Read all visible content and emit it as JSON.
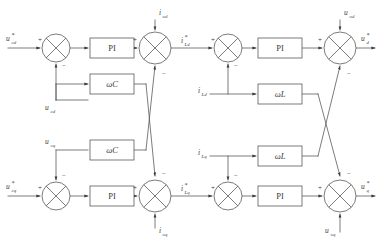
{
  "diagram": {
    "type": "control-block-diagram",
    "title": "",
    "background_color": "#ffffff",
    "line_color": "#5a5a5a",
    "text_color": "#3a3a3a",
    "blocks": [
      {
        "id": "pi-1",
        "label": "PI",
        "x": 90,
        "y": 38,
        "w": 44,
        "h": 20,
        "style": "upright"
      },
      {
        "id": "wc-1",
        "label": "ωC",
        "x": 90,
        "y": 74,
        "w": 44,
        "h": 20,
        "style": "italic"
      },
      {
        "id": "wc-2",
        "label": "ωC",
        "x": 90,
        "y": 140,
        "w": 44,
        "h": 20,
        "style": "italic"
      },
      {
        "id": "pi-2",
        "label": "PI",
        "x": 90,
        "y": 186,
        "w": 44,
        "h": 20,
        "style": "upright"
      },
      {
        "id": "pi-3",
        "label": "PI",
        "x": 258,
        "y": 38,
        "w": 44,
        "h": 20,
        "style": "upright"
      },
      {
        "id": "wl-1",
        "label": "ωL",
        "x": 258,
        "y": 84,
        "w": 44,
        "h": 20,
        "style": "italic"
      },
      {
        "id": "wl-2",
        "label": "ωL",
        "x": 258,
        "y": 146,
        "w": 44,
        "h": 20,
        "style": "italic"
      },
      {
        "id": "pi-4",
        "label": "PI",
        "x": 258,
        "y": 186,
        "w": 44,
        "h": 20,
        "style": "upright"
      }
    ],
    "summers": [
      {
        "id": "sum-1",
        "cx": 56,
        "cy": 48,
        "r": 14
      },
      {
        "id": "sum-2",
        "cx": 155,
        "cy": 48,
        "r": 16
      },
      {
        "id": "sum-3",
        "cx": 56,
        "cy": 196,
        "r": 14
      },
      {
        "id": "sum-4",
        "cx": 155,
        "cy": 196,
        "r": 16
      },
      {
        "id": "sum-5",
        "cx": 228,
        "cy": 48,
        "r": 14
      },
      {
        "id": "sum-6",
        "cx": 340,
        "cy": 48,
        "r": 16
      },
      {
        "id": "sum-7",
        "cx": 228,
        "cy": 196,
        "r": 14
      },
      {
        "id": "sum-8",
        "cx": 340,
        "cy": 196,
        "r": 16
      }
    ],
    "signals": {
      "vref_d": {
        "base": "u",
        "star": true,
        "sub": "cd",
        "x": 6,
        "y": 41
      },
      "vref_q": {
        "base": "u",
        "star": true,
        "sub": "cq",
        "x": 6,
        "y": 189
      },
      "vfb_d": {
        "base": "u",
        "star": false,
        "sub": "cd",
        "x": 47,
        "y": 103
      },
      "vfb_q": {
        "base": "u",
        "star": false,
        "sub": "cq",
        "x": 47,
        "y": 143
      },
      "i_od": {
        "base": "i",
        "star": false,
        "sub": "od",
        "x": 160,
        "y": 14
      },
      "i_oq": {
        "base": "i",
        "star": false,
        "sub": "oq",
        "x": 160,
        "y": 236
      },
      "iref_Ld": {
        "base": "i",
        "star": true,
        "sub": "Ld",
        "x": 182,
        "y": 43
      },
      "iref_Lq": {
        "base": "i",
        "star": true,
        "sub": "Lq",
        "x": 182,
        "y": 191
      },
      "i_Ld": {
        "base": "i",
        "star": false,
        "sub": "Ld",
        "x": 201,
        "y": 93
      },
      "i_Lq": {
        "base": "i",
        "star": false,
        "sub": "Lq",
        "x": 201,
        "y": 155
      },
      "u_od": {
        "base": "u",
        "star": false,
        "sub": "od",
        "x": 345,
        "y": 14
      },
      "u_oq": {
        "base": "u",
        "star": false,
        "sub": "oq",
        "x": 330,
        "y": 236
      },
      "uout_d": {
        "base": "u",
        "star": true,
        "sub": "d",
        "x": 363,
        "y": 41
      },
      "uout_q": {
        "base": "u",
        "star": true,
        "sub": "q",
        "x": 363,
        "y": 189
      }
    },
    "signs": [
      {
        "id": "sign-s1-plus",
        "text": "+",
        "x": 38,
        "y": 42
      },
      {
        "id": "sign-s1-minus",
        "text": "−",
        "x": 62,
        "y": 66
      },
      {
        "id": "sign-s2-plus",
        "text": "+",
        "x": 134,
        "y": 42
      },
      {
        "id": "sign-s2-minus",
        "text": "−",
        "x": 161,
        "y": 74
      },
      {
        "id": "sign-s3-plus",
        "text": "+",
        "x": 38,
        "y": 190
      },
      {
        "id": "sign-s3-minus",
        "text": "−",
        "x": 62,
        "y": 174
      },
      {
        "id": "sign-s4-plus",
        "text": "+",
        "x": 134,
        "y": 190
      },
      {
        "id": "sign-s4-minus",
        "text": "−",
        "x": 161,
        "y": 172
      },
      {
        "id": "sign-s5-plus",
        "text": "+",
        "x": 211,
        "y": 42
      },
      {
        "id": "sign-s5-minus",
        "text": "−",
        "x": 234,
        "y": 66
      },
      {
        "id": "sign-s6-plus",
        "text": "+",
        "x": 319,
        "y": 42
      },
      {
        "id": "sign-s6-minus",
        "text": "−",
        "x": 346,
        "y": 74
      },
      {
        "id": "sign-s7-plus",
        "text": "+",
        "x": 211,
        "y": 190
      },
      {
        "id": "sign-s7-minus",
        "text": "−",
        "x": 234,
        "y": 174
      },
      {
        "id": "sign-s8-plus",
        "text": "+",
        "x": 319,
        "y": 190
      },
      {
        "id": "sign-s8-minus",
        "text": "−",
        "x": 346,
        "y": 172
      }
    ]
  }
}
